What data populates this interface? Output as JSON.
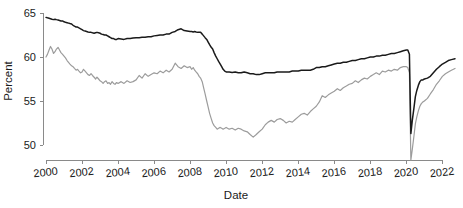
{
  "chart_data": {
    "type": "line",
    "title": "",
    "xlabel": "Date",
    "ylabel": "Percent",
    "xlim": [
      2000.0,
      2022.7
    ],
    "ylim": [
      47.8,
      65.6
    ],
    "grid": false,
    "legend_position": "none",
    "xticks": [
      "2000",
      "2002",
      "2004",
      "2006",
      "2008",
      "2010",
      "2012",
      "2014",
      "2016",
      "2018",
      "2020",
      "2022"
    ],
    "xtick_values": [
      2000,
      2002,
      2004,
      2006,
      2008,
      2010,
      2012,
      2014,
      2016,
      2018,
      2020,
      2022
    ],
    "yticks": [
      "50",
      "55",
      "60",
      "65"
    ],
    "ytick_values": [
      50,
      55,
      60,
      65
    ],
    "colors": {
      "primary": "#1a1a1a",
      "secondary": "#9c9c9c",
      "axis": "#8a8a8a",
      "background": "#ffffff"
    },
    "series": [
      {
        "name": "primary-series",
        "color": "#1a1a1a",
        "x": [
          2000.0,
          2000.08,
          2000.17,
          2000.25,
          2000.33,
          2000.42,
          2000.5,
          2000.58,
          2000.67,
          2000.75,
          2000.83,
          2000.92,
          2001.0,
          2001.08,
          2001.17,
          2001.25,
          2001.33,
          2001.42,
          2001.5,
          2001.58,
          2001.67,
          2001.75,
          2001.83,
          2001.92,
          2002.0,
          2002.08,
          2002.17,
          2002.25,
          2002.33,
          2002.42,
          2002.5,
          2002.58,
          2002.67,
          2002.75,
          2002.83,
          2002.92,
          2003.0,
          2003.08,
          2003.17,
          2003.25,
          2003.33,
          2003.42,
          2003.5,
          2003.58,
          2003.67,
          2003.75,
          2003.83,
          2003.92,
          2004.0,
          2004.17,
          2004.33,
          2004.5,
          2004.67,
          2004.83,
          2005.0,
          2005.17,
          2005.33,
          2005.5,
          2005.67,
          2005.83,
          2006.0,
          2006.17,
          2006.33,
          2006.5,
          2006.67,
          2006.83,
          2007.0,
          2007.17,
          2007.33,
          2007.5,
          2007.67,
          2007.83,
          2008.0,
          2008.08,
          2008.17,
          2008.25,
          2008.33,
          2008.42,
          2008.5,
          2008.58,
          2008.67,
          2008.75,
          2008.83,
          2008.92,
          2009.0,
          2009.08,
          2009.17,
          2009.25,
          2009.33,
          2009.42,
          2009.5,
          2009.58,
          2009.67,
          2009.75,
          2009.83,
          2009.92,
          2010.0,
          2010.17,
          2010.33,
          2010.5,
          2010.67,
          2010.83,
          2011.0,
          2011.17,
          2011.33,
          2011.5,
          2011.67,
          2011.83,
          2012.0,
          2012.17,
          2012.33,
          2012.5,
          2012.67,
          2012.83,
          2013.0,
          2013.17,
          2013.33,
          2013.5,
          2013.67,
          2013.83,
          2014.0,
          2014.17,
          2014.33,
          2014.5,
          2014.67,
          2014.83,
          2015.0,
          2015.17,
          2015.33,
          2015.5,
          2015.67,
          2015.83,
          2016.0,
          2016.17,
          2016.33,
          2016.5,
          2016.67,
          2016.83,
          2017.0,
          2017.17,
          2017.33,
          2017.5,
          2017.67,
          2017.83,
          2018.0,
          2018.17,
          2018.33,
          2018.5,
          2018.67,
          2018.83,
          2019.0,
          2019.17,
          2019.33,
          2019.5,
          2019.67,
          2019.83,
          2020.0,
          2020.08,
          2020.17,
          2020.25,
          2020.33,
          2020.42,
          2020.5,
          2020.58,
          2020.67,
          2020.75,
          2020.83,
          2020.92,
          2021.0,
          2021.17,
          2021.33,
          2021.5,
          2021.67,
          2021.83,
          2022.0,
          2022.17,
          2022.33,
          2022.5,
          2022.7
        ],
        "y": [
          64.5,
          64.45,
          64.4,
          64.35,
          64.3,
          64.25,
          64.3,
          64.25,
          64.2,
          64.15,
          64.1,
          64.1,
          64.0,
          63.95,
          63.9,
          63.85,
          63.8,
          63.75,
          63.6,
          63.5,
          63.4,
          63.4,
          63.3,
          63.2,
          63.1,
          63.0,
          62.95,
          62.9,
          62.85,
          62.8,
          62.8,
          62.75,
          62.7,
          62.75,
          62.8,
          62.75,
          62.7,
          62.6,
          62.55,
          62.5,
          62.5,
          62.4,
          62.3,
          62.2,
          62.1,
          62.1,
          62.0,
          62.0,
          62.1,
          62.05,
          62.0,
          62.1,
          62.1,
          62.15,
          62.2,
          62.2,
          62.25,
          62.25,
          62.3,
          62.3,
          62.4,
          62.45,
          62.5,
          62.5,
          62.6,
          62.6,
          62.8,
          62.9,
          63.1,
          63.2,
          63.0,
          62.95,
          62.9,
          62.9,
          62.85,
          62.9,
          62.85,
          62.8,
          62.8,
          62.8,
          62.6,
          62.4,
          62.2,
          62.0,
          61.7,
          61.4,
          61.1,
          60.9,
          60.5,
          60.1,
          59.8,
          59.5,
          59.2,
          58.9,
          58.6,
          58.4,
          58.3,
          58.3,
          58.25,
          58.3,
          58.2,
          58.2,
          58.3,
          58.2,
          58.1,
          58.1,
          58.0,
          58.0,
          58.1,
          58.2,
          58.2,
          58.2,
          58.2,
          58.3,
          58.3,
          58.3,
          58.3,
          58.3,
          58.4,
          58.4,
          58.4,
          58.5,
          58.5,
          58.5,
          58.5,
          58.6,
          58.8,
          58.8,
          58.9,
          58.9,
          59.0,
          59.1,
          59.2,
          59.3,
          59.3,
          59.4,
          59.4,
          59.5,
          59.6,
          59.6,
          59.7,
          59.8,
          59.8,
          59.9,
          60.0,
          60.0,
          60.1,
          60.1,
          60.2,
          60.2,
          60.3,
          60.4,
          60.4,
          60.5,
          60.6,
          60.7,
          60.8,
          60.8,
          60.3,
          51.3,
          52.8,
          54.2,
          55.5,
          56.2,
          56.8,
          57.2,
          57.4,
          57.4,
          57.5,
          57.6,
          57.8,
          58.2,
          58.6,
          58.9,
          59.2,
          59.4,
          59.6,
          59.7,
          59.8
        ]
      },
      {
        "name": "secondary-series",
        "color": "#9c9c9c",
        "x": [
          2000.0,
          2000.08,
          2000.17,
          2000.25,
          2000.33,
          2000.42,
          2000.5,
          2000.58,
          2000.67,
          2000.75,
          2000.83,
          2000.92,
          2001.0,
          2001.08,
          2001.17,
          2001.25,
          2001.33,
          2001.42,
          2001.5,
          2001.58,
          2001.67,
          2001.75,
          2001.83,
          2001.92,
          2002.0,
          2002.08,
          2002.17,
          2002.25,
          2002.33,
          2002.42,
          2002.5,
          2002.58,
          2002.67,
          2002.75,
          2002.83,
          2002.92,
          2003.0,
          2003.08,
          2003.17,
          2003.25,
          2003.33,
          2003.42,
          2003.5,
          2003.58,
          2003.67,
          2003.75,
          2003.83,
          2003.92,
          2004.0,
          2004.17,
          2004.33,
          2004.5,
          2004.67,
          2004.83,
          2005.0,
          2005.17,
          2005.33,
          2005.5,
          2005.67,
          2005.83,
          2006.0,
          2006.17,
          2006.33,
          2006.5,
          2006.67,
          2006.83,
          2007.0,
          2007.17,
          2007.33,
          2007.5,
          2007.67,
          2007.83,
          2008.0,
          2008.08,
          2008.17,
          2008.25,
          2008.33,
          2008.42,
          2008.5,
          2008.58,
          2008.67,
          2008.75,
          2008.83,
          2008.92,
          2009.0,
          2009.08,
          2009.17,
          2009.25,
          2009.33,
          2009.42,
          2009.5,
          2009.58,
          2009.67,
          2009.75,
          2009.83,
          2009.92,
          2010.0,
          2010.17,
          2010.33,
          2010.5,
          2010.67,
          2010.83,
          2011.0,
          2011.17,
          2011.33,
          2011.5,
          2011.67,
          2011.83,
          2012.0,
          2012.17,
          2012.33,
          2012.5,
          2012.67,
          2012.83,
          2013.0,
          2013.17,
          2013.33,
          2013.5,
          2013.67,
          2013.83,
          2014.0,
          2014.17,
          2014.33,
          2014.5,
          2014.67,
          2014.83,
          2015.0,
          2015.17,
          2015.33,
          2015.5,
          2015.67,
          2015.83,
          2016.0,
          2016.17,
          2016.33,
          2016.5,
          2016.67,
          2016.83,
          2017.0,
          2017.17,
          2017.33,
          2017.5,
          2017.67,
          2017.83,
          2018.0,
          2018.17,
          2018.33,
          2018.5,
          2018.67,
          2018.83,
          2019.0,
          2019.17,
          2019.33,
          2019.5,
          2019.67,
          2019.83,
          2020.0,
          2020.08,
          2020.17,
          2020.25,
          2020.33,
          2020.42,
          2020.5,
          2020.58,
          2020.67,
          2020.75,
          2020.83,
          2020.92,
          2021.0,
          2021.17,
          2021.33,
          2021.5,
          2021.67,
          2021.83,
          2022.0,
          2022.17,
          2022.33,
          2022.5,
          2022.7
        ],
        "y": [
          60.0,
          60.3,
          60.8,
          61.2,
          60.9,
          60.4,
          60.6,
          60.9,
          61.1,
          60.8,
          60.5,
          60.3,
          60.1,
          59.9,
          59.6,
          59.4,
          59.2,
          59.0,
          58.9,
          58.7,
          58.5,
          58.6,
          58.4,
          58.2,
          58.3,
          58.6,
          58.4,
          58.2,
          58.0,
          57.9,
          58.1,
          57.9,
          57.7,
          57.5,
          57.7,
          57.5,
          57.3,
          57.2,
          57.0,
          57.2,
          57.3,
          57.0,
          57.1,
          56.9,
          57.2,
          57.0,
          56.9,
          57.1,
          57.0,
          57.2,
          57.0,
          57.3,
          57.1,
          57.2,
          57.4,
          57.9,
          57.6,
          58.1,
          57.8,
          58.0,
          58.2,
          58.1,
          58.4,
          58.2,
          58.5,
          58.3,
          58.6,
          59.3,
          58.9,
          58.7,
          59.0,
          58.8,
          58.9,
          58.6,
          58.8,
          58.5,
          58.3,
          58.1,
          57.8,
          57.6,
          57.2,
          56.5,
          55.8,
          55.0,
          54.3,
          53.6,
          53.0,
          52.5,
          52.2,
          52.0,
          51.8,
          51.9,
          52.0,
          51.9,
          51.8,
          51.9,
          52.0,
          51.8,
          51.9,
          51.7,
          51.9,
          51.8,
          51.6,
          51.5,
          51.2,
          50.9,
          51.2,
          51.5,
          51.8,
          52.3,
          52.6,
          52.8,
          52.6,
          52.9,
          53.0,
          52.8,
          52.5,
          52.7,
          52.6,
          52.9,
          53.2,
          53.5,
          53.6,
          53.4,
          53.8,
          54.1,
          54.4,
          54.9,
          55.6,
          55.4,
          55.7,
          55.9,
          56.1,
          56.4,
          56.2,
          56.5,
          56.7,
          56.9,
          57.0,
          57.3,
          57.1,
          57.4,
          57.6,
          57.5,
          57.8,
          58.0,
          58.2,
          58.0,
          58.4,
          58.3,
          58.5,
          58.4,
          58.6,
          58.5,
          58.8,
          58.9,
          58.9,
          58.8,
          58.2,
          48.3,
          49.5,
          51.0,
          52.4,
          53.2,
          53.9,
          54.4,
          54.7,
          54.9,
          55.0,
          55.3,
          55.8,
          56.3,
          56.9,
          57.3,
          57.8,
          58.1,
          58.3,
          58.5,
          58.7
        ]
      }
    ]
  }
}
